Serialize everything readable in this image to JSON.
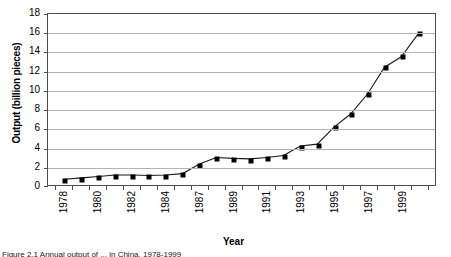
{
  "chart_data": {
    "type": "line",
    "title": "",
    "xlabel": "Year",
    "ylabel": "Output (billion pieces)",
    "ylim": [
      0,
      18
    ],
    "ytick_values": [
      0,
      2,
      4,
      6,
      8,
      10,
      12,
      14,
      16,
      18
    ],
    "ytick_labels": [
      "0",
      "2",
      "4",
      "6",
      "8",
      "10",
      "12",
      "14",
      "16",
      "18"
    ],
    "grid": true,
    "legend": "none",
    "xtick_labels": [
      "1978",
      "",
      "1980",
      "",
      "1982",
      "",
      "1984",
      "",
      "1987",
      "",
      "1989",
      "",
      "1991",
      "",
      "1993",
      "",
      "1995",
      "",
      "1997",
      "",
      "1999",
      ""
    ],
    "x": [
      "1978",
      "1979",
      "1980",
      "1981",
      "1982",
      "1983",
      "1984",
      "1985",
      "1986",
      "1987",
      "1988",
      "1989",
      "1990",
      "1991",
      "1992",
      "1993",
      "1994",
      "1995",
      "1996",
      "1997",
      "1998",
      "1999"
    ],
    "values": [
      0.6,
      0.75,
      0.9,
      1.05,
      1.05,
      1.0,
      1.05,
      1.2,
      2.2,
      2.9,
      2.8,
      2.75,
      2.9,
      3.1,
      4.1,
      4.3,
      6.1,
      7.5,
      9.6,
      12.4,
      13.5,
      15.9
    ],
    "series": [
      {
        "name": "Output",
        "marker": "square",
        "color": "#000000",
        "values": [
          0.6,
          0.75,
          0.9,
          1.05,
          1.05,
          1.0,
          1.05,
          1.2,
          2.2,
          2.9,
          2.8,
          2.75,
          2.9,
          3.1,
          4.1,
          4.3,
          6.1,
          7.5,
          9.6,
          12.4,
          13.5,
          15.9
        ]
      }
    ]
  },
  "figure": {
    "caption": "Figure 2.1  Annual output of ... in China, 1978-1999"
  }
}
